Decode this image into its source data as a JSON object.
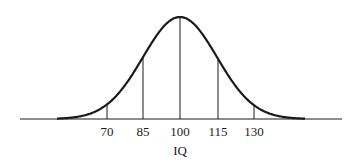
{
  "chart_data": {
    "type": "line",
    "title": "",
    "xlabel": "IQ",
    "ylabel": "",
    "x_ticks": [
      70,
      85,
      100,
      115,
      130
    ],
    "x_tick_labels": [
      "70",
      "85",
      "100",
      "115",
      "130"
    ],
    "mean": 100,
    "sd": 15,
    "series": [
      {
        "name": "IQ distribution",
        "x": [
          55,
          70,
          85,
          100,
          115,
          130,
          145
        ],
        "y_relative": [
          0.01,
          0.14,
          0.61,
          1.0,
          0.61,
          0.14,
          0.01
        ]
      }
    ],
    "grid": false,
    "legend": "none"
  },
  "axis": {
    "label": "IQ"
  },
  "ticks": [
    {
      "label": "70",
      "x": 107
    },
    {
      "label": "85",
      "x": 143
    },
    {
      "label": "100",
      "x": 180
    },
    {
      "label": "115",
      "x": 218
    },
    {
      "label": "130",
      "x": 254
    }
  ],
  "colors": {
    "ink": "#1a1a1a",
    "background": "#ffffff"
  }
}
